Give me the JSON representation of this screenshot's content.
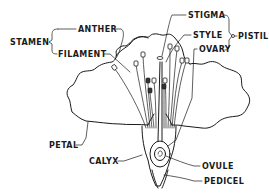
{
  "diagram": {
    "type": "labeled botanical cross-section",
    "colors": {
      "ink": "#1a1a1a",
      "background": "#ffffff"
    },
    "labels": {
      "stamen": "STAMEN",
      "anther": "ANTHER",
      "filament": "FILAMENT",
      "stigma": "STIGMA",
      "style": "STYLE",
      "pistil": "PISTIL",
      "ovary": "OVARY",
      "petal": "PETAL",
      "calyx": "CALYX",
      "ovule": "OVULE",
      "pedicel": "PEDICEL"
    },
    "groups": [
      {
        "name": "STAMEN",
        "parts": [
          "ANTHER",
          "FILAMENT"
        ]
      },
      {
        "name": "PISTIL",
        "parts": [
          "STIGMA",
          "STYLE",
          "OVARY"
        ]
      }
    ]
  }
}
